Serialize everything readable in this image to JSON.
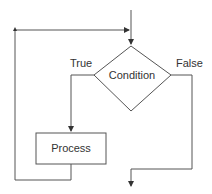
{
  "diagram": {
    "type": "flowchart",
    "title": "",
    "nodes": [
      {
        "id": "condition",
        "shape": "diamond",
        "label": "Condition"
      },
      {
        "id": "process",
        "shape": "rectangle",
        "label": "Process"
      }
    ],
    "edges": [
      {
        "from": "entry",
        "to": "condition",
        "label": ""
      },
      {
        "from": "condition",
        "to": "process",
        "label": "True"
      },
      {
        "from": "process",
        "to": "condition",
        "label": "",
        "note": "loop back"
      },
      {
        "from": "condition",
        "to": "exit",
        "label": "False"
      }
    ],
    "labels": {
      "condition": "Condition",
      "process": "Process",
      "true_branch": "True",
      "false_branch": "False"
    },
    "colors": {
      "stroke": "#555555",
      "text": "#333333",
      "background": "#ffffff"
    }
  }
}
